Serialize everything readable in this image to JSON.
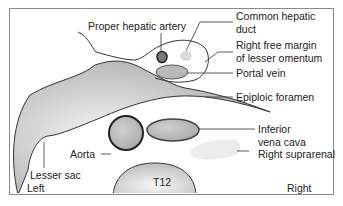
{
  "diagram": {
    "type": "anatomical cross-section",
    "labels": {
      "proper_hepatic_artery": "Proper hepatic artery",
      "common_hepatic_duct_1": "Common hepatic",
      "common_hepatic_duct_2": "duct",
      "right_free_margin_1": "Right free margin",
      "right_free_margin_2": "of lesser omentum",
      "portal_vein": "Portal vein",
      "epiploic_foramen": "Epiploic foramen",
      "ivc_1": "Inferior",
      "ivc_2": "vena cava",
      "right_suprarenal": "Right suprarenal",
      "aorta": "Aorta",
      "lesser_sac": "Lesser sac",
      "t12": "T12",
      "left": "Left",
      "right": "Right"
    },
    "colors": {
      "outline": "#333333",
      "gray_fill": "#bdbdbd",
      "vessel_fill": "#b8b8b8",
      "artery_fill": "#808080",
      "duct_fill": "#dddddd",
      "suprarenal_fill": "#ececec",
      "frame": "#8a8a8a"
    }
  }
}
